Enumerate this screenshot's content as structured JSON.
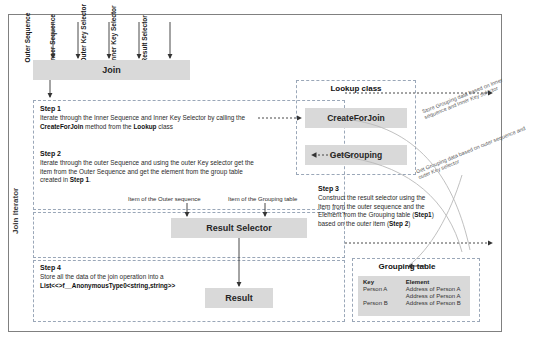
{
  "diagram": {
    "frame_label": "Join Iterator",
    "inputs": [
      {
        "label": "Outer Sequence"
      },
      {
        "label": "Inner Sequence"
      },
      {
        "label": "Outer Key Selector"
      },
      {
        "label": "Inner Key Selector"
      },
      {
        "label": "Result Selector"
      }
    ],
    "join_box": "Join",
    "lookup": {
      "title": "Lookup class",
      "methods": [
        "CreateForJoin",
        "GetGrouping"
      ]
    },
    "steps": [
      {
        "title": "Step 1",
        "text_parts": [
          {
            "t": "Iterate through the Inner Sequence and Inner Key Selector by calling the ",
            "b": false
          },
          {
            "t": "CreateForJoin",
            "b": true
          },
          {
            "t": " method from the ",
            "b": false
          },
          {
            "t": "Lookup",
            "b": true
          },
          {
            "t": " class",
            "b": false
          }
        ]
      },
      {
        "title": "Step 2",
        "text_parts": [
          {
            "t": "Iterate through the outer Sequence and using the outer Key selector get the item from the Outer Sequence and get the element from the group table created in ",
            "b": false
          },
          {
            "t": "Step 1",
            "b": true
          },
          {
            "t": ".",
            "b": false
          }
        ]
      },
      {
        "title": "Step 3",
        "text_parts": [
          {
            "t": "Construct the result selector using the Item from the outer sequence and the Element from the Grouping table (",
            "b": false
          },
          {
            "t": "Step1",
            "b": true
          },
          {
            "t": ") based on the outer item (",
            "b": false
          },
          {
            "t": "Step 2",
            "b": true
          },
          {
            "t": ")",
            "b": false
          }
        ]
      },
      {
        "title": "Step 4",
        "text_parts": [
          {
            "t": "Store all the data of the join operation into a ",
            "b": false
          },
          {
            "t": "List<<>f__AnonymousType0<string,string>>",
            "b": true
          }
        ]
      }
    ],
    "result_selector_box": "Result Selector",
    "result_box": "Result",
    "selector_input_labels": [
      "Item of the Outer sequence",
      "Item of the Grouping table"
    ],
    "flow_labels": [
      "Store Grouping data based on Inner sequence and Inner Key selector",
      "Get Grouping data based on outer sequence and outer Key selector"
    ],
    "grouping_table": {
      "title": "Grouping table",
      "columns": [
        "Key",
        "Element"
      ],
      "rows": [
        [
          "Person A",
          "Address of Person A"
        ],
        [
          "",
          "Address of Person A"
        ],
        [
          "Person B",
          "Address of Person B"
        ]
      ]
    },
    "colors": {
      "box_fill": "#d9d9d9",
      "frame_border": "#808080",
      "dashed_border": "#9aa7b8",
      "line": "#404040"
    }
  }
}
